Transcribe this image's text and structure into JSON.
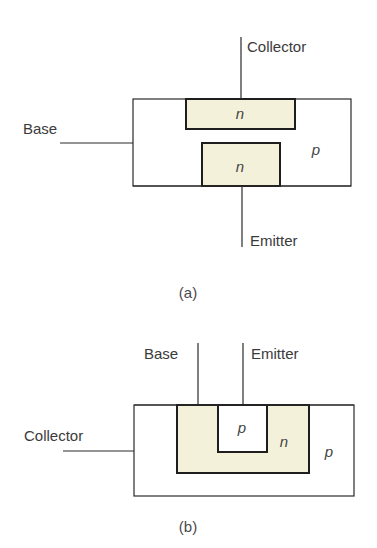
{
  "figure": {
    "type": "transistor-cross-sections",
    "colors": {
      "n_region_fill": "#F4F1DA",
      "line": "#2a2a2a",
      "text": "#3a3a3a"
    },
    "panel_a": {
      "caption": "(a)",
      "leads": {
        "collector": "Collector",
        "base": "Base",
        "emitter": "Emitter"
      },
      "regions": {
        "collector_region": "n",
        "emitter_region": "n",
        "substrate": "p"
      }
    },
    "panel_b": {
      "caption": "(b)",
      "leads": {
        "base": "Base",
        "emitter": "Emitter",
        "collector": "Collector"
      },
      "regions": {
        "emitter_region": "p",
        "base_region": "n",
        "substrate": "p"
      }
    }
  }
}
